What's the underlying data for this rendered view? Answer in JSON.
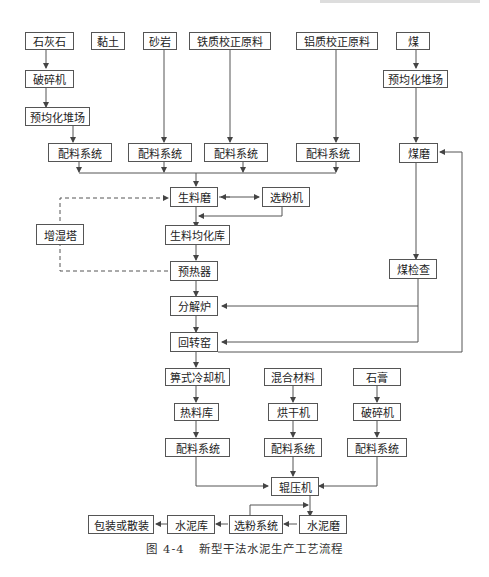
{
  "diagram": {
    "title": "新型干法水泥生产工艺流程",
    "figure_label": "图 4-4",
    "nodes": {
      "limestone": "石灰石",
      "clay": "黏土",
      "sandstone": "砂岩",
      "iron_corrective": "铁质校正原料",
      "aluminum_corrective": "铝质校正原料",
      "coal": "煤",
      "crusher1": "破碎机",
      "prehomo1": "预均化堆场",
      "coal_prehomo": "预均化堆场",
      "batch1": "配料系统",
      "batch2": "配料系统",
      "batch3": "配料系统",
      "batch4": "配料系统",
      "coal_mill": "煤磨",
      "raw_mill": "生料磨",
      "separator": "选粉机",
      "humidifier": "增湿塔",
      "raw_homo": "生料均化库",
      "preheater": "预热器",
      "coal_bin": "煤检查",
      "calciner": "分解炉",
      "kiln": "回转窑",
      "cooler": "箅式冷却机",
      "mixed_material": "混合材料",
      "gypsum": "石膏",
      "clinker_bin": "热料库",
      "dryer": "烘干机",
      "crusher2": "破碎机",
      "batch5": "配料系统",
      "batch6": "配料系统",
      "batch7": "配料系统",
      "roller_press": "辊压机",
      "cement_mill": "水泥磨",
      "powder_sep": "选粉系统",
      "cement_silo": "水泥库",
      "packing": "包装或散装"
    }
  }
}
